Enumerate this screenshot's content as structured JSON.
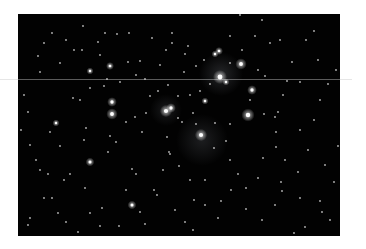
{
  "image": {
    "subject": "star cluster",
    "frame": {
      "x": 18,
      "y": 14,
      "w": 322,
      "h": 222,
      "background": "#020202"
    },
    "scanline_y": 79,
    "nebula": [
      {
        "x": 221,
        "y": 74,
        "r": 22,
        "opacity": 0.18
      },
      {
        "x": 202,
        "y": 140,
        "r": 26,
        "opacity": 0.14
      },
      {
        "x": 166,
        "y": 110,
        "r": 16,
        "opacity": 0.12
      }
    ],
    "bright_stars": [
      {
        "x": 220,
        "y": 77,
        "r": 3.2
      },
      {
        "x": 241,
        "y": 64,
        "r": 2.6
      },
      {
        "x": 248,
        "y": 115,
        "r": 3.0
      },
      {
        "x": 201,
        "y": 135,
        "r": 2.8
      },
      {
        "x": 166,
        "y": 111,
        "r": 2.8
      },
      {
        "x": 171,
        "y": 108,
        "r": 2.2
      },
      {
        "x": 112,
        "y": 114,
        "r": 2.6
      },
      {
        "x": 112,
        "y": 102,
        "r": 2.2
      },
      {
        "x": 252,
        "y": 90,
        "r": 2.2
      },
      {
        "x": 90,
        "y": 162,
        "r": 2.0
      },
      {
        "x": 132,
        "y": 205,
        "r": 2.0
      },
      {
        "x": 219,
        "y": 51,
        "r": 1.8
      },
      {
        "x": 215,
        "y": 54,
        "r": 1.6
      },
      {
        "x": 110,
        "y": 66,
        "r": 1.8
      },
      {
        "x": 90,
        "y": 71,
        "r": 1.6
      },
      {
        "x": 56,
        "y": 123,
        "r": 1.6
      },
      {
        "x": 226,
        "y": 82,
        "r": 1.6
      },
      {
        "x": 205,
        "y": 101,
        "r": 1.6
      }
    ],
    "faint_stars": [
      [
        74,
        50
      ],
      [
        82,
        50
      ],
      [
        44,
        43
      ],
      [
        52,
        33
      ],
      [
        83,
        26
      ],
      [
        105,
        33
      ],
      [
        117,
        34
      ],
      [
        129,
        33
      ],
      [
        172,
        33
      ],
      [
        185,
        54
      ],
      [
        172,
        43
      ],
      [
        166,
        50
      ],
      [
        184,
        72
      ],
      [
        136,
        75
      ],
      [
        145,
        79
      ],
      [
        200,
        91
      ],
      [
        168,
        85
      ],
      [
        210,
        84
      ],
      [
        230,
        63
      ],
      [
        258,
        70
      ],
      [
        265,
        76
      ],
      [
        287,
        81
      ],
      [
        264,
        114
      ],
      [
        275,
        117
      ],
      [
        283,
        95
      ],
      [
        278,
        112
      ],
      [
        250,
        100
      ],
      [
        196,
        124
      ],
      [
        215,
        123
      ],
      [
        230,
        124
      ],
      [
        193,
        113
      ],
      [
        178,
        118
      ],
      [
        135,
        117
      ],
      [
        146,
        113
      ],
      [
        120,
        82
      ],
      [
        104,
        86
      ],
      [
        107,
        79
      ],
      [
        90,
        88
      ],
      [
        80,
        100
      ],
      [
        86,
        128
      ],
      [
        116,
        142
      ],
      [
        110,
        136
      ],
      [
        84,
        140
      ],
      [
        108,
        152
      ],
      [
        167,
        137
      ],
      [
        169,
        152
      ],
      [
        163,
        170
      ],
      [
        179,
        166
      ],
      [
        190,
        180
      ],
      [
        238,
        174
      ],
      [
        258,
        178
      ],
      [
        281,
        182
      ],
      [
        298,
        172
      ],
      [
        282,
        191
      ],
      [
        246,
        188
      ],
      [
        221,
        201
      ],
      [
        246,
        209
      ],
      [
        275,
        205
      ],
      [
        300,
        198
      ],
      [
        320,
        201
      ],
      [
        325,
        165
      ],
      [
        308,
        150
      ],
      [
        276,
        147
      ],
      [
        320,
        100
      ],
      [
        318,
        60
      ],
      [
        306,
        40
      ],
      [
        314,
        31
      ],
      [
        270,
        43
      ],
      [
        242,
        50
      ],
      [
        240,
        15
      ],
      [
        262,
        20
      ],
      [
        60,
        146
      ],
      [
        50,
        132
      ],
      [
        40,
        170
      ],
      [
        44,
        198
      ],
      [
        52,
        198
      ],
      [
        28,
        225
      ],
      [
        30,
        218
      ],
      [
        78,
        232
      ],
      [
        100,
        226
      ],
      [
        119,
        226
      ],
      [
        90,
        213
      ],
      [
        102,
        208
      ],
      [
        140,
        212
      ],
      [
        185,
        222
      ],
      [
        193,
        230
      ],
      [
        218,
        218
      ],
      [
        262,
        220
      ],
      [
        294,
        233
      ],
      [
        305,
        227
      ],
      [
        330,
        220
      ],
      [
        322,
        212
      ],
      [
        157,
        195
      ],
      [
        136,
        174
      ],
      [
        132,
        169
      ],
      [
        154,
        190
      ],
      [
        126,
        190
      ],
      [
        170,
        154
      ],
      [
        214,
        148
      ],
      [
        230,
        160
      ],
      [
        194,
        200
      ],
      [
        205,
        205
      ],
      [
        85,
        188
      ],
      [
        70,
        174
      ],
      [
        64,
        180
      ],
      [
        36,
        160
      ],
      [
        21,
        130
      ],
      [
        24,
        95
      ],
      [
        40,
        72
      ],
      [
        60,
        63
      ],
      [
        73,
        98
      ],
      [
        98,
        42
      ],
      [
        152,
        38
      ],
      [
        188,
        46
      ],
      [
        204,
        60
      ],
      [
        196,
        66
      ],
      [
        230,
        36
      ],
      [
        255,
        36
      ],
      [
        280,
        40
      ],
      [
        292,
        62
      ],
      [
        300,
        82
      ],
      [
        336,
        70
      ],
      [
        338,
        146
      ],
      [
        334,
        182
      ],
      [
        285,
        160
      ],
      [
        276,
        132
      ],
      [
        226,
        141
      ],
      [
        182,
        122
      ],
      [
        142,
        132
      ],
      [
        126,
        122
      ],
      [
        150,
        96
      ],
      [
        158,
        91
      ],
      [
        178,
        96
      ],
      [
        190,
        95
      ],
      [
        140,
        61
      ],
      [
        160,
        65
      ],
      [
        128,
        62
      ],
      [
        100,
        55
      ],
      [
        66,
        40
      ],
      [
        38,
        56
      ],
      [
        28,
        112
      ],
      [
        30,
        145
      ],
      [
        48,
        174
      ],
      [
        58,
        213
      ],
      [
        66,
        222
      ],
      [
        112,
        240
      ],
      [
        145,
        224
      ],
      [
        175,
        210
      ],
      [
        205,
        180
      ],
      [
        231,
        190
      ],
      [
        263,
        158
      ],
      [
        300,
        130
      ],
      [
        314,
        120
      ],
      [
        328,
        84
      ]
    ]
  }
}
